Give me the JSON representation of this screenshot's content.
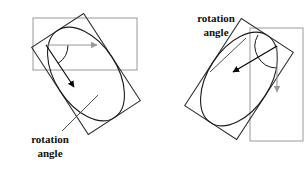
{
  "figure": {
    "background": "#ffffff",
    "width": 307,
    "height": 171,
    "colors": {
      "object_outline": "#1a1a1a",
      "rotated_box": "#2b2b2b",
      "aligned_box": "#9a9a9a",
      "aligned_arrow": "#9a9a9a",
      "object_arrow": "#000000",
      "leader_line": "#3a3a3a",
      "arc": "#1a1a1a",
      "label_text": "#111111"
    }
  },
  "panels": [
    {
      "id": "left",
      "label": {
        "line1": "rotation",
        "line2": "angle",
        "x": 50,
        "y": 143
      },
      "ellipse": {
        "cx": 86,
        "cy": 74,
        "rx": 52,
        "ry": 31,
        "rotation_deg": 57
      },
      "rotated_box": {
        "cx": 86,
        "cy": 74,
        "w": 104,
        "h": 62,
        "rotation_deg": 57
      },
      "aligned_box": {
        "x": 33,
        "y": 18,
        "w": 104,
        "h": 52
      },
      "aligned_arrow": {
        "x1": 46,
        "y1": 45,
        "x2": 97,
        "y2": 45,
        "direction": "right",
        "color": "#9a9a9a"
      },
      "object_arrow": {
        "x1": 46,
        "y1": 45,
        "x2": 74,
        "y2": 87,
        "direction": "down-right",
        "color": "#000000"
      },
      "arc": {
        "cx": 46,
        "cy": 45,
        "r": 22,
        "start_deg": 0,
        "end_deg": 57
      },
      "leader": {
        "x1": 62,
        "y1": 131,
        "x2": 98,
        "y2": 95
      }
    },
    {
      "id": "right",
      "label": {
        "line1": "rotation",
        "line2": "angle",
        "x": 216,
        "y": 22
      },
      "ellipse": {
        "cx": 239,
        "cy": 79,
        "rx": 52,
        "ry": 31,
        "rotation_deg": -57
      },
      "rotated_box": {
        "cx": 239,
        "cy": 79,
        "w": 104,
        "h": 62,
        "rotation_deg": -57
      },
      "aligned_box": {
        "x": 250,
        "y": 28,
        "w": 53,
        "h": 113
      },
      "aligned_arrow": {
        "x1": 277,
        "y1": 46,
        "x2": 277,
        "y2": 92,
        "direction": "down",
        "color": "#9a9a9a"
      },
      "object_arrow": {
        "x1": 277,
        "y1": 46,
        "x2": 233,
        "y2": 72,
        "direction": "up-left",
        "color": "#000000"
      },
      "arc": {
        "cx": 277,
        "cy": 46,
        "r": 22,
        "start_deg": 90,
        "end_deg": 210
      },
      "leader": {
        "x1": 246,
        "y1": 38,
        "x2": 210,
        "y2": 72
      }
    }
  ]
}
